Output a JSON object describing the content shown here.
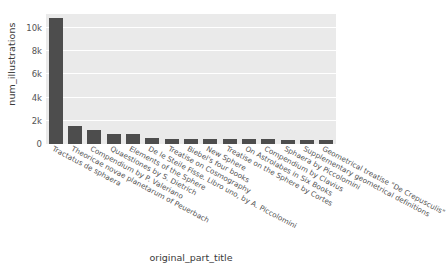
{
  "chart_data": {
    "type": "bar",
    "title": "",
    "xlabel": "original_part_title",
    "ylabel": "num_illustrations",
    "ylim": [
      0,
      11200
    ],
    "grid": true,
    "legend": null,
    "bar_color": "#4d4d4d",
    "plot_background": "#eaeaea",
    "gridline_color": "#ffffff",
    "yticks": [
      {
        "value": 0,
        "label": "0"
      },
      {
        "value": 2000,
        "label": "2k"
      },
      {
        "value": 4000,
        "label": "4k"
      },
      {
        "value": 6000,
        "label": "6k"
      },
      {
        "value": 8000,
        "label": "8k"
      },
      {
        "value": 10000,
        "label": "10k"
      }
    ],
    "categories": [
      "Tractatus de sphaera",
      "Theoricae novae planetarum of Peuerbach",
      "Compendium by P. Valeriano",
      "Quaestiones by S. Dietrich",
      "Elements of the Sphere",
      "De le Steile Fisse. Libro uno, by A. Piccolomini",
      "Treatise on Cosmography",
      "Biebel's four books",
      "New Sphere",
      "Treatise on the Sphere by Cortes",
      "On Astrolabes in Six Books",
      "Compendium by Clavius",
      "Sphaera by Piccolomini",
      "Supplementary geometrical definitions",
      "Geometrical treatise \"De Crepusculis\""
    ],
    "values": [
      10850,
      1520,
      1200,
      880,
      820,
      520,
      470,
      450,
      440,
      430,
      420,
      400,
      380,
      360,
      330
    ]
  }
}
